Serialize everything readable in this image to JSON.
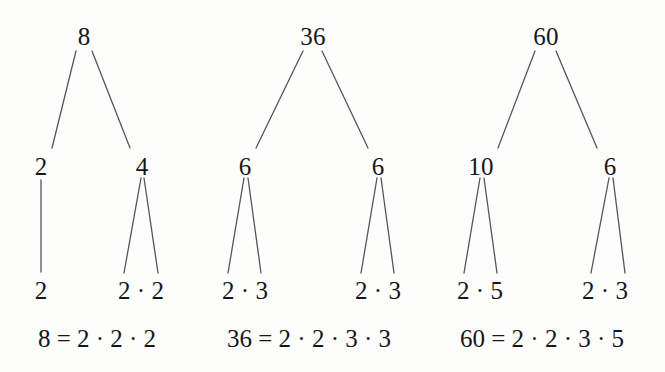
{
  "figure": {
    "background_color": "#fdfdfb",
    "edge_color": "#55555a",
    "text_color": "#16161a"
  },
  "chart_data": {
    "type": "diagram",
    "subtype": "factor-tree",
    "trees": [
      {
        "root": "8",
        "level2": [
          "2",
          "4"
        ],
        "leaves": [
          "2",
          "2 · 2"
        ],
        "equation": "8 = 2 · 2 · 2"
      },
      {
        "root": "36",
        "level2": [
          "6",
          "6"
        ],
        "leaves": [
          "2 · 3",
          "2 · 3"
        ],
        "equation": "36 = 2 · 2 · 3 · 3"
      },
      {
        "root": "60",
        "level2": [
          "10",
          "6"
        ],
        "leaves": [
          "2 · 5",
          "2 · 3"
        ],
        "equation": "60 = 2 · 2 · 3 · 5"
      }
    ]
  },
  "trees": [
    {
      "id": "tree-8",
      "root": {
        "label": "8",
        "x": 84,
        "y": 36
      },
      "children": [
        {
          "label": "2",
          "x": 41,
          "y": 166
        },
        {
          "label": "4",
          "x": 142,
          "y": 166
        }
      ],
      "leaves": [
        {
          "label": "2",
          "x": 41,
          "y": 290
        },
        {
          "label": "2 · 2",
          "x": 141,
          "y": 290
        }
      ],
      "equation": {
        "label": "8 = 2 · 2 · 2",
        "x": 97,
        "y": 338
      },
      "edges": [
        {
          "x1": 76,
          "y1": 51,
          "x2": 52,
          "y2": 148
        },
        {
          "x1": 92,
          "y1": 51,
          "x2": 130,
          "y2": 148
        },
        {
          "x1": 41,
          "y1": 180,
          "x2": 41,
          "y2": 272
        },
        {
          "x1": 141,
          "y1": 178,
          "x2": 124,
          "y2": 273
        },
        {
          "x1": 144,
          "y1": 178,
          "x2": 158,
          "y2": 273
        }
      ]
    },
    {
      "id": "tree-36",
      "root": {
        "label": "36",
        "x": 313,
        "y": 36
      },
      "children": [
        {
          "label": "6",
          "x": 245,
          "y": 166
        },
        {
          "label": "6",
          "x": 378,
          "y": 166
        }
      ],
      "leaves": [
        {
          "label": "2 · 3",
          "x": 245,
          "y": 290
        },
        {
          "label": "2 · 3",
          "x": 378,
          "y": 290
        }
      ],
      "equation": {
        "label": "36 = 2 · 2 · 3 · 3",
        "x": 309,
        "y": 338
      },
      "edges": [
        {
          "x1": 303,
          "y1": 51,
          "x2": 256,
          "y2": 148
        },
        {
          "x1": 322,
          "y1": 51,
          "x2": 368,
          "y2": 148
        },
        {
          "x1": 244,
          "y1": 178,
          "x2": 228,
          "y2": 273
        },
        {
          "x1": 248,
          "y1": 178,
          "x2": 261,
          "y2": 273
        },
        {
          "x1": 377,
          "y1": 178,
          "x2": 361,
          "y2": 273
        },
        {
          "x1": 381,
          "y1": 178,
          "x2": 394,
          "y2": 273
        }
      ]
    },
    {
      "id": "tree-60",
      "root": {
        "label": "60",
        "x": 546,
        "y": 36
      },
      "children": [
        {
          "label": "10",
          "x": 481,
          "y": 166
        },
        {
          "label": "6",
          "x": 610,
          "y": 166
        }
      ],
      "leaves": [
        {
          "label": "2 · 5",
          "x": 480,
          "y": 290
        },
        {
          "label": "2 · 3",
          "x": 605,
          "y": 290
        }
      ],
      "equation": {
        "label": "60 = 2 · 2 · 3 · 5",
        "x": 542,
        "y": 338
      },
      "edges": [
        {
          "x1": 535,
          "y1": 51,
          "x2": 498,
          "y2": 148
        },
        {
          "x1": 556,
          "y1": 51,
          "x2": 597,
          "y2": 148
        },
        {
          "x1": 480,
          "y1": 178,
          "x2": 464,
          "y2": 273
        },
        {
          "x1": 484,
          "y1": 178,
          "x2": 497,
          "y2": 273
        },
        {
          "x1": 609,
          "y1": 178,
          "x2": 591,
          "y2": 273
        },
        {
          "x1": 613,
          "y1": 178,
          "x2": 625,
          "y2": 273
        }
      ]
    }
  ]
}
